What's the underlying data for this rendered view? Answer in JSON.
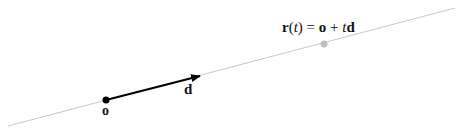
{
  "diagram": {
    "ray_line": {
      "x1": 8,
      "y1": 126,
      "x2": 455,
      "y2": 8,
      "color": "#c8c8c8"
    },
    "origin_point": {
      "x": 106,
      "y": 100,
      "color": "#000000",
      "label": "o"
    },
    "direction_vector": {
      "x1": 106,
      "y1": 100,
      "x2": 200,
      "y2": 76,
      "color": "#000000",
      "label": "d"
    },
    "sample_point": {
      "x": 324,
      "y": 44,
      "color": "#c0c0c0"
    },
    "equation": {
      "r": "r",
      "open": "(",
      "t1": "t",
      "close": ")",
      "eq": " = ",
      "o": "o",
      "plus": " + ",
      "t2": "t",
      "d": "d"
    }
  }
}
